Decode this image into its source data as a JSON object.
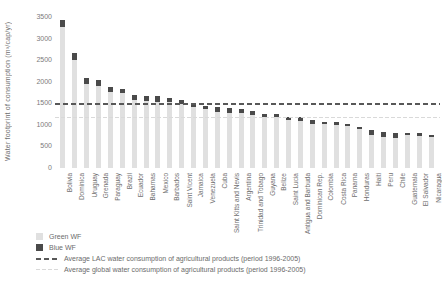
{
  "chart_data": {
    "type": "bar",
    "stacked": true,
    "title": "",
    "xlabel": "",
    "ylabel": "Water footprint of consumption (m³/cap/yr)",
    "ylim": [
      0,
      3500
    ],
    "yticks": [
      0,
      500,
      1000,
      1500,
      2000,
      2500,
      3000,
      3500
    ],
    "grid": false,
    "legend_position": "bottom-left",
    "categories": [
      "Bolivia",
      "Dominica",
      "Uruguay",
      "Grenada",
      "Paraguay",
      "Brazil",
      "Ecuador",
      "Bahamas",
      "Mexico",
      "Barbados",
      "Saint Vicent",
      "Jamaica",
      "Venezuela",
      "Cuba",
      "Saint Kitts and Nevis",
      "Argentina",
      "Trinidad and Tobago",
      "Guyana",
      "Belize",
      "Saint Lucia",
      "Antigua and Barbuda",
      "Dominican Rep.",
      "Colombia",
      "Costa Rica",
      "Panama",
      "Honduras",
      "Haiti",
      "Peru",
      "Chile",
      "Guatemala",
      "El Salvador",
      "Nicaragua"
    ],
    "series": [
      {
        "name": "Green WF",
        "color": "#e0e0e0",
        "values": [
          3260,
          2510,
          1940,
          1900,
          1760,
          1730,
          1570,
          1550,
          1520,
          1520,
          1480,
          1420,
          1360,
          1290,
          1280,
          1280,
          1220,
          1180,
          1190,
          1120,
          1100,
          1030,
          1010,
          1000,
          980,
          900,
          760,
          710,
          700,
          760,
          740,
          720
        ]
      },
      {
        "name": "Blue WF",
        "color": "#4a4a4a",
        "values": [
          160,
          150,
          140,
          130,
          110,
          100,
          130,
          120,
          140,
          110,
          100,
          90,
          80,
          120,
          100,
          90,
          90,
          80,
          60,
          70,
          90,
          80,
          60,
          60,
          50,
          60,
          120,
          130,
          120,
          60,
          60,
          50
        ]
      }
    ],
    "reference_lines": [
      {
        "label": "Average LAC water consumption of agricultural products (period 1996-2005)",
        "value": 1470,
        "style": "dashed-dark"
      },
      {
        "label": "Average global water consumption of agricultural products (period 1996-2005)",
        "value": 1150,
        "style": "dashed-light"
      }
    ]
  },
  "legend": {
    "items": [
      {
        "label": "Green WF"
      },
      {
        "label": "Blue WF"
      },
      {
        "label": "Average LAC water consumption of agricultural products (period 1996-2005)"
      },
      {
        "label": "Average global water consumption of agricultural products (period 1996-2005)"
      }
    ]
  },
  "colors": {
    "green_wf": "#e0e0e0",
    "blue_wf": "#4a4a4a",
    "lac_average_line": "#585858",
    "global_average_line": "#d9d9d9",
    "text": "#6e6e6e",
    "background": "#ffffff"
  }
}
